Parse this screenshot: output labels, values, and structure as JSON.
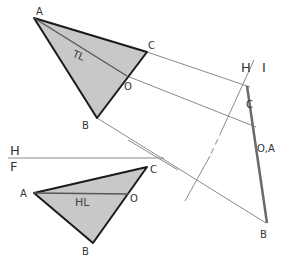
{
  "diagram": {
    "colors": {
      "fill": "#c8c8c8",
      "edge": "#1a1a1a",
      "projection": "#8a8a8a",
      "edge_view": "#6a6a6a",
      "true_length": "#555555",
      "text": "#333333"
    },
    "top_view": {
      "points": {
        "A": "A",
        "B": "B",
        "C": "C",
        "O": "O"
      },
      "line_label": "TL"
    },
    "front_view": {
      "points": {
        "A": "A",
        "B": "B",
        "C": "C",
        "O": "O"
      },
      "line_label": "HL"
    },
    "fold_lines": {
      "hf_top": "H",
      "hf_bottom": "F",
      "h1_left": "H",
      "h1_right": "I"
    },
    "auxiliary_view": {
      "C": "C",
      "OA": "O,A",
      "B": "B"
    }
  }
}
